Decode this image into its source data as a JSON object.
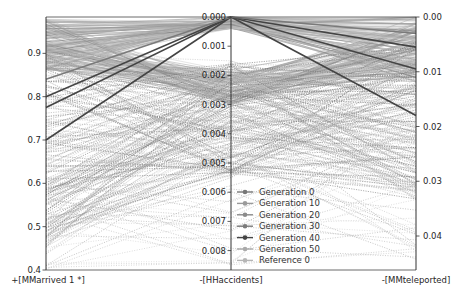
{
  "chart_data": {
    "type": "parallel_coordinates",
    "title": "",
    "axes": [
      {
        "name": "+[MMarrived 1 *]",
        "direction": "normal",
        "range": [
          0.4,
          0.98
        ],
        "ticks": [
          0.4,
          0.5,
          0.6,
          0.7,
          0.8,
          0.9
        ],
        "tick_labels": [
          "0.4",
          "0.5",
          "0.6",
          "0.7",
          "0.8",
          "0.9"
        ]
      },
      {
        "name": "-[HHaccidents]",
        "direction": "inverted",
        "range": [
          0.0,
          0.0086
        ],
        "ticks": [
          0.0,
          0.001,
          0.002,
          0.003,
          0.004,
          0.005,
          0.006,
          0.007,
          0.008
        ],
        "tick_labels": [
          "0.000",
          "0.001",
          "0.002",
          "0.003",
          "0.004",
          "0.005",
          "0.006",
          "0.007",
          "0.008"
        ]
      },
      {
        "name": "-[MMteleported]",
        "direction": "inverted",
        "range": [
          0.0,
          0.046
        ],
        "ticks": [
          0.0,
          0.01,
          0.02,
          0.03,
          0.04
        ],
        "tick_labels": [
          "0.00",
          "0.01",
          "0.02",
          "0.03",
          "0.04"
        ]
      }
    ],
    "legend": {
      "position": "center-right",
      "entries": [
        {
          "label": "Generation 0",
          "color": "#777777"
        },
        {
          "label": "Generation 10",
          "color": "#9a9a9a"
        },
        {
          "label": "Generation 20",
          "color": "#8a8a8a"
        },
        {
          "label": "Generation 30",
          "color": "#7a7a7a"
        },
        {
          "label": "Generation 40",
          "color": "#444444"
        },
        {
          "label": "Generation 50",
          "color": "#aaaaaa"
        },
        {
          "label": "Reference 0",
          "color": "#b5b5b5"
        }
      ]
    },
    "highlighted_lines": [
      {
        "series": "Generation 40",
        "values": [
          0.7,
          0.0,
          0.018
        ]
      },
      {
        "series": "Generation 40",
        "values": [
          0.775,
          0.0,
          0.0095
        ]
      },
      {
        "series": "Generation 40",
        "values": [
          0.8,
          0.0,
          0.0055
        ]
      },
      {
        "series": "Generation 30",
        "values": [
          0.84,
          0.0,
          0.003
        ]
      }
    ],
    "grid": false
  }
}
